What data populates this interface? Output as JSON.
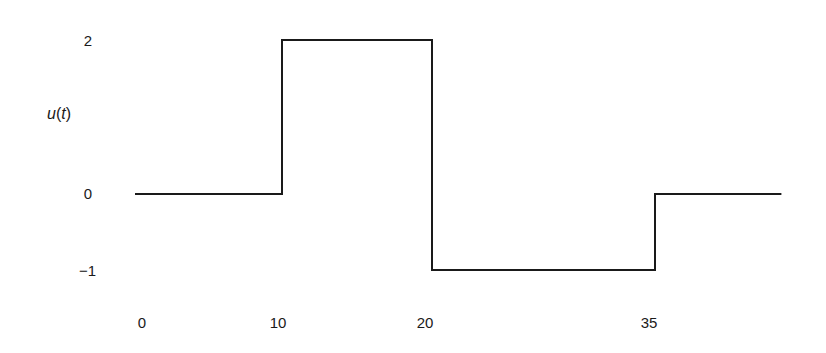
{
  "chart_data": {
    "type": "line",
    "step": true,
    "title": "",
    "xlabel": "",
    "ylabel": "u(t)",
    "ylabel_parts": {
      "fn": "u",
      "open": "(",
      "var": "t",
      "close": ")"
    },
    "x": [
      -0.5,
      10,
      10,
      20,
      20,
      35,
      35,
      43.5
    ],
    "y": [
      0,
      0,
      2,
      2,
      -1,
      -1,
      0,
      0
    ],
    "segments": [
      {
        "from": 0,
        "to": 10,
        "value": 0
      },
      {
        "from": 10,
        "to": 20,
        "value": 2
      },
      {
        "from": 20,
        "to": 35,
        "value": -1
      },
      {
        "from": 35,
        "to": 44,
        "value": 0
      }
    ],
    "xticks": [
      "0",
      "10",
      "20",
      "35"
    ],
    "xtick_values": [
      0,
      10,
      20,
      35
    ],
    "yticks": [
      "2",
      "0",
      "−1"
    ],
    "ytick_values": [
      2,
      0,
      -1
    ],
    "grid": false,
    "axes_visible": false,
    "line_color": "#1a1a1a"
  }
}
